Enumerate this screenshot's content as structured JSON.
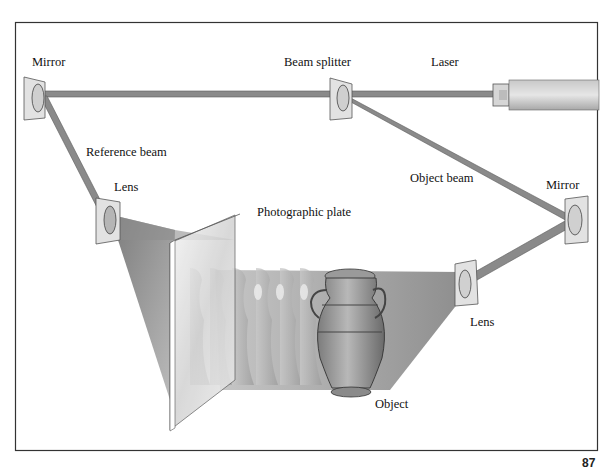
{
  "diagram": {
    "labels": {
      "mirror_top": "Mirror",
      "beam_splitter": "Beam splitter",
      "laser": "Laser",
      "reference_beam": "Reference beam",
      "lens_left": "Lens",
      "photographic_plate": "Photographic plate",
      "object_beam": "Object beam",
      "mirror_right": "Mirror",
      "lens_right": "Lens",
      "object": "Object"
    },
    "page_number": "87",
    "nodes": [
      "Laser",
      "Beam splitter",
      "Mirror (top-left)",
      "Lens (left)",
      "Photographic plate",
      "Mirror (right)",
      "Lens (right)",
      "Object"
    ],
    "edges": [
      {
        "from": "Laser",
        "to": "Beam splitter",
        "label": ""
      },
      {
        "from": "Beam splitter",
        "to": "Mirror (top-left)",
        "label": ""
      },
      {
        "from": "Mirror (top-left)",
        "to": "Lens (left)",
        "label": "Reference beam"
      },
      {
        "from": "Lens (left)",
        "to": "Photographic plate",
        "label": ""
      },
      {
        "from": "Beam splitter",
        "to": "Mirror (right)",
        "label": "Object beam"
      },
      {
        "from": "Mirror (right)",
        "to": "Lens (right)",
        "label": ""
      },
      {
        "from": "Lens (right)",
        "to": "Object",
        "label": ""
      },
      {
        "from": "Object",
        "to": "Photographic plate",
        "label": ""
      }
    ],
    "colors": {
      "beam": "#8a8a8a",
      "beam_edge": "#5a5a5a",
      "frame": "#333333",
      "cone": "#9a9a9a",
      "mount": "#d8d8d8"
    }
  }
}
